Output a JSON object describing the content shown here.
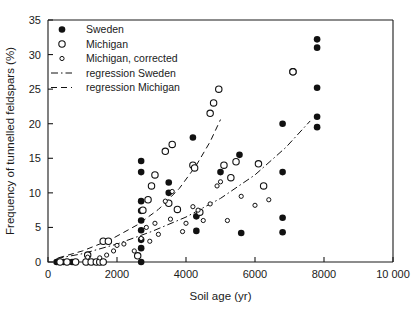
{
  "chart_data": {
    "type": "scatter",
    "title": "",
    "xlabel": "Soil age (yr)",
    "ylabel": "Frequency of tunnelled feldspars (%)",
    "xlim": [
      0,
      10000
    ],
    "ylim": [
      0,
      35
    ],
    "xticks": [
      0,
      2000,
      4000,
      6000,
      8000,
      10000
    ],
    "xtick_labels": [
      "0",
      "2000",
      "4000",
      "6000",
      "8000",
      "10 000"
    ],
    "yticks": [
      0,
      5,
      10,
      15,
      20,
      25,
      30,
      35
    ],
    "ytick_labels": [
      "0",
      "5",
      "10",
      "15",
      "20",
      "25",
      "30",
      "35"
    ],
    "grid": false,
    "legend_position": "top-left",
    "legend": [
      {
        "label": "Sweden",
        "marker": "filled-circle"
      },
      {
        "label": "Michigan",
        "marker": "open-circle"
      },
      {
        "label": "Michigan, corrected",
        "marker": "small-open-circle"
      },
      {
        "label": "regression Sweden",
        "marker": "dash-dot-line"
      },
      {
        "label": "regression Michigan",
        "marker": "dashed-line"
      }
    ],
    "series": [
      {
        "name": "Sweden",
        "marker": "filled-circle",
        "points": [
          [
            250,
            0
          ],
          [
            450,
            0
          ],
          [
            700,
            0
          ],
          [
            1150,
            0
          ],
          [
            1300,
            0
          ],
          [
            1500,
            0
          ],
          [
            2700,
            0
          ],
          [
            2700,
            2.0
          ],
          [
            2700,
            3.2
          ],
          [
            2700,
            4.6
          ],
          [
            2700,
            6.0
          ],
          [
            2700,
            7.4
          ],
          [
            2700,
            8.8
          ],
          [
            2700,
            13.0
          ],
          [
            2700,
            14.6
          ],
          [
            3500,
            11.5
          ],
          [
            3500,
            10.0
          ],
          [
            4200,
            18.0
          ],
          [
            4300,
            4.5
          ],
          [
            4300,
            6.6
          ],
          [
            5000,
            13.0
          ],
          [
            5550,
            15.5
          ],
          [
            5600,
            4.2
          ],
          [
            6800,
            4.3
          ],
          [
            6800,
            6.4
          ],
          [
            6800,
            13.0
          ],
          [
            6800,
            20.0
          ],
          [
            7800,
            19.5
          ],
          [
            7800,
            21.0
          ],
          [
            7800,
            25.2
          ],
          [
            7800,
            31.0
          ],
          [
            7800,
            32.2
          ]
        ]
      },
      {
        "name": "Michigan",
        "marker": "open-circle",
        "points": [
          [
            350,
            0
          ],
          [
            550,
            0
          ],
          [
            800,
            0
          ],
          [
            1100,
            0
          ],
          [
            1250,
            0
          ],
          [
            1400,
            0
          ],
          [
            1500,
            0
          ],
          [
            1600,
            0
          ],
          [
            1150,
            1.0
          ],
          [
            1600,
            3.0
          ],
          [
            1750,
            3.0
          ],
          [
            2600,
            0.9
          ],
          [
            2750,
            7.5
          ],
          [
            2900,
            9.0
          ],
          [
            3000,
            11.0
          ],
          [
            3100,
            12.6
          ],
          [
            3400,
            16.0
          ],
          [
            3600,
            17.0
          ],
          [
            3500,
            8.5
          ],
          [
            3750,
            7.6
          ],
          [
            4200,
            14.0
          ],
          [
            4250,
            13.6
          ],
          [
            4400,
            7.2
          ],
          [
            4700,
            21.5
          ],
          [
            4800,
            23.0
          ],
          [
            4950,
            25.0
          ],
          [
            5100,
            14.0
          ],
          [
            5450,
            14.5
          ],
          [
            5300,
            12.2
          ],
          [
            6100,
            14.2
          ],
          [
            6250,
            11.0
          ],
          [
            7100,
            27.5
          ]
        ]
      },
      {
        "name": "Michigan, corrected",
        "marker": "small-open-circle",
        "points": [
          [
            1150,
            0.7
          ],
          [
            1500,
            0.6
          ],
          [
            1700,
            1.0
          ],
          [
            1900,
            1.6
          ],
          [
            2000,
            2.4
          ],
          [
            2200,
            2.6
          ],
          [
            2500,
            1.6
          ],
          [
            2700,
            3.4
          ],
          [
            2850,
            5.0
          ],
          [
            2950,
            3.0
          ],
          [
            3100,
            5.6
          ],
          [
            3200,
            4.0
          ],
          [
            3400,
            8.8
          ],
          [
            3550,
            6.2
          ],
          [
            3600,
            10.2
          ],
          [
            3900,
            4.4
          ],
          [
            4000,
            5.6
          ],
          [
            4200,
            8.0
          ],
          [
            4350,
            7.5
          ],
          [
            4500,
            6.0
          ],
          [
            4700,
            8.4
          ],
          [
            4900,
            11.0
          ],
          [
            5000,
            11.6
          ],
          [
            5200,
            6.0
          ],
          [
            5600,
            9.5
          ],
          [
            6000,
            8.2
          ],
          [
            6400,
            9.0
          ]
        ]
      }
    ],
    "regressions": [
      {
        "name": "regression Sweden",
        "style": "dash-dot",
        "path": [
          [
            250,
            0.5
          ],
          [
            1000,
            1.2
          ],
          [
            2000,
            2.6
          ],
          [
            3000,
            4.4
          ],
          [
            4000,
            6.5
          ],
          [
            5000,
            9.2
          ],
          [
            6000,
            12.6
          ],
          [
            6900,
            16.6
          ],
          [
            7600,
            20.4
          ]
        ]
      },
      {
        "name": "regression Michigan",
        "style": "dashed",
        "path": [
          [
            300,
            0.6
          ],
          [
            1000,
            1.6
          ],
          [
            1800,
            3.2
          ],
          [
            2600,
            5.4
          ],
          [
            3200,
            7.6
          ],
          [
            3800,
            10.6
          ],
          [
            4300,
            14.0
          ],
          [
            4700,
            17.4
          ],
          [
            5000,
            20.6
          ]
        ]
      }
    ],
    "stray_markers": [
      {
        "x": 7100,
        "y": 27.5,
        "marker": "open-circle",
        "note": "overlaps legend text"
      }
    ]
  }
}
